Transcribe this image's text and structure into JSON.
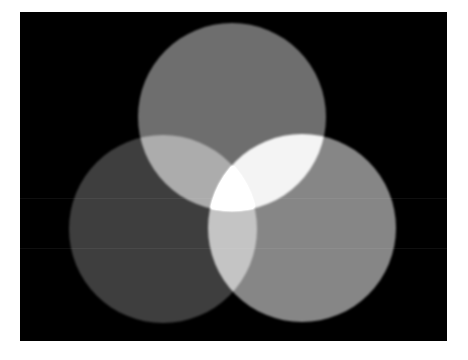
{
  "image": {
    "description": "Three overlapping grayscale circles on a black background (additive light mixing)",
    "background_color": "#000000",
    "page_color": "#ffffff",
    "circles": [
      {
        "name": "top-circle",
        "cx": 232,
        "cy": 117,
        "r": 94,
        "color": "#6e6e6e"
      },
      {
        "name": "left-circle",
        "cx": 163,
        "cy": 229,
        "r": 94,
        "color": "#3e3e3e"
      },
      {
        "name": "right-circle",
        "cx": 302,
        "cy": 228,
        "r": 94,
        "color": "#868686"
      }
    ],
    "overlap_colors": {
      "top_left": "#999999",
      "top_right": "#d6d6d6",
      "left_right": "#7b7b7b",
      "all_three": "#ffffff"
    }
  }
}
